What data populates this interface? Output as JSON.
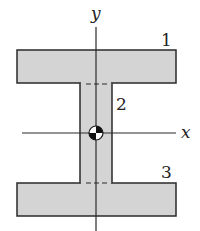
{
  "diagram": {
    "type": "I-beam cross-section",
    "axes": {
      "x_label": "x",
      "y_label": "y"
    },
    "parts": [
      {
        "id": "1",
        "label": "1",
        "name": "top-flange"
      },
      {
        "id": "2",
        "label": "2",
        "name": "web"
      },
      {
        "id": "3",
        "label": "3",
        "name": "bottom-flange"
      }
    ],
    "centroid_symbol": "centroid",
    "colors": {
      "fill": "#d4d4d4",
      "stroke": "#2a2a2a",
      "background": "#ffffff"
    }
  }
}
